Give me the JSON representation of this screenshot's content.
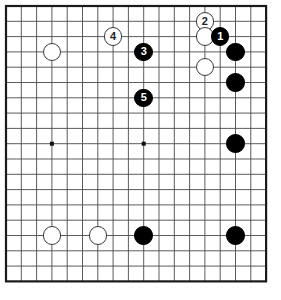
{
  "document": {
    "type": "go-game-diagram",
    "title": "Go board position diagram",
    "background_color": "#ffffff"
  },
  "board": {
    "name": "go-board",
    "columns_visible": 18,
    "rows_visible": 19,
    "grid_spacing_px": 15.3,
    "origin_x_px": 6,
    "origin_y_px": 6,
    "line_color": "#4a4a4a",
    "border_color": "#1a1a1a",
    "board_color": "#ffffff",
    "star_points": [
      {
        "name": "star-point-left",
        "col": 3,
        "row": 9
      },
      {
        "name": "star-point-center",
        "col": 9,
        "row": 9
      }
    ]
  },
  "legend": {
    "black_label": "Black stone",
    "white_label": "White stone",
    "numbered_label": "Numbered move"
  },
  "stones": [
    {
      "name": "white-stone-upper-left",
      "color": "white",
      "col": 3,
      "row": 3,
      "label": ""
    },
    {
      "name": "white-move-4",
      "color": "white",
      "col": 7,
      "row": 2,
      "label": "4"
    },
    {
      "name": "black-move-3",
      "color": "black",
      "col": 9,
      "row": 3,
      "label": "3"
    },
    {
      "name": "black-move-5",
      "color": "black",
      "col": 9,
      "row": 6,
      "label": "5"
    },
    {
      "name": "white-move-2",
      "color": "white",
      "col": 13,
      "row": 1,
      "label": "2"
    },
    {
      "name": "white-stone-upper-right",
      "color": "white",
      "col": 13,
      "row": 2,
      "label": ""
    },
    {
      "name": "black-move-1",
      "color": "black",
      "col": 14,
      "row": 2,
      "label": "1"
    },
    {
      "name": "white-stone-right-side",
      "color": "white",
      "col": 13,
      "row": 4,
      "label": ""
    },
    {
      "name": "black-stone-right-a",
      "color": "black",
      "col": 15,
      "row": 3,
      "label": ""
    },
    {
      "name": "black-stone-right-b",
      "color": "black",
      "col": 15,
      "row": 5,
      "label": ""
    },
    {
      "name": "black-stone-right-c",
      "color": "black",
      "col": 15,
      "row": 9,
      "label": ""
    },
    {
      "name": "white-stone-bottom-a",
      "color": "white",
      "col": 3,
      "row": 15,
      "label": ""
    },
    {
      "name": "white-stone-bottom-b",
      "color": "white",
      "col": 6,
      "row": 15,
      "label": ""
    },
    {
      "name": "black-stone-bottom-a",
      "color": "black",
      "col": 9,
      "row": 15,
      "label": ""
    },
    {
      "name": "black-stone-bottom-b",
      "color": "black",
      "col": 15,
      "row": 15,
      "label": ""
    }
  ],
  "moves": [
    {
      "number": "1",
      "color": "black"
    },
    {
      "number": "2",
      "color": "white"
    },
    {
      "number": "3",
      "color": "black"
    },
    {
      "number": "4",
      "color": "white"
    },
    {
      "number": "5",
      "color": "black"
    }
  ]
}
